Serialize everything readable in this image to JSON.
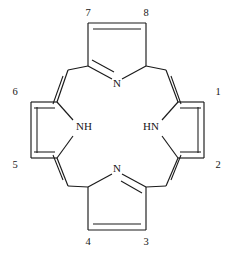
{
  "figure": {
    "kind": "chemical-structure-diagram",
    "name": "porphine",
    "background_color": "#ffffff",
    "line_color": "#1a1a1a",
    "width": 235,
    "height": 256
  },
  "atom_labels": [
    {
      "id": "nitrogen-top",
      "text": "N",
      "x": 117,
      "y": 84
    },
    {
      "id": "nitrogen-bottom",
      "text": "N",
      "x": 117,
      "y": 169
    },
    {
      "id": "nitrogen-left-nh",
      "text": "NH",
      "x": 84,
      "y": 127
    },
    {
      "id": "nitrogen-right-hn",
      "text": "HN",
      "x": 151,
      "y": 127
    }
  ],
  "locant_labels": [
    {
      "id": "locant-1",
      "text": "1",
      "x": 218,
      "y": 93
    },
    {
      "id": "locant-2",
      "text": "2",
      "x": 218,
      "y": 166
    },
    {
      "id": "locant-3",
      "text": "3",
      "x": 146,
      "y": 243
    },
    {
      "id": "locant-4",
      "text": "4",
      "x": 88,
      "y": 243
    },
    {
      "id": "locant-5",
      "text": "5",
      "x": 15,
      "y": 166
    },
    {
      "id": "locant-6",
      "text": "6",
      "x": 15,
      "y": 93
    },
    {
      "id": "locant-7",
      "text": "7",
      "x": 88,
      "y": 14
    },
    {
      "id": "locant-8",
      "text": "8",
      "x": 146,
      "y": 14
    }
  ],
  "bonds": [
    {
      "id": "top-ring-beta-beta",
      "x1": 88,
      "y1": 23,
      "x2": 146,
      "y2": 23
    },
    {
      "id": "top-ring-beta7-alpha",
      "x1": 88,
      "y1": 23,
      "x2": 88,
      "y2": 66
    },
    {
      "id": "top-ring-beta8-alpha",
      "x1": 146,
      "y1": 23,
      "x2": 146,
      "y2": 66
    },
    {
      "id": "top-ring-alpha-n-left",
      "x1": 88,
      "y1": 66,
      "x2": 112,
      "y2": 79
    },
    {
      "id": "top-ring-alpha-n-right",
      "x1": 146,
      "y1": 66,
      "x2": 122,
      "y2": 79
    },
    {
      "id": "bottom-ring-beta-beta",
      "x1": 88,
      "y1": 230,
      "x2": 146,
      "y2": 230
    },
    {
      "id": "bottom-ring-beta4-alpha",
      "x1": 88,
      "y1": 230,
      "x2": 88,
      "y2": 187
    },
    {
      "id": "bottom-ring-beta3-alpha",
      "x1": 146,
      "y1": 230,
      "x2": 146,
      "y2": 187
    },
    {
      "id": "bottom-ring-alpha-n-left",
      "x1": 88,
      "y1": 187,
      "x2": 112,
      "y2": 174
    },
    {
      "id": "bottom-ring-alpha-n-right",
      "x1": 146,
      "y1": 187,
      "x2": 122,
      "y2": 174
    },
    {
      "id": "left-ring-beta-beta",
      "x1": 31,
      "y1": 102,
      "x2": 31,
      "y2": 158
    },
    {
      "id": "left-ring-beta6-alpha",
      "x1": 31,
      "y1": 102,
      "x2": 57,
      "y2": 102
    },
    {
      "id": "left-ring-beta5-alpha",
      "x1": 31,
      "y1": 158,
      "x2": 57,
      "y2": 158
    },
    {
      "id": "left-ring-alpha-nh-top",
      "x1": 57,
      "y1": 102,
      "x2": 73,
      "y2": 120
    },
    {
      "id": "left-ring-alpha-nh-bottom",
      "x1": 57,
      "y1": 158,
      "x2": 73,
      "y2": 136
    },
    {
      "id": "right-ring-beta-beta",
      "x1": 204,
      "y1": 102,
      "x2": 204,
      "y2": 158
    },
    {
      "id": "right-ring-beta1-alpha",
      "x1": 204,
      "y1": 102,
      "x2": 178,
      "y2": 102
    },
    {
      "id": "right-ring-beta2-alpha",
      "x1": 204,
      "y1": 158,
      "x2": 178,
      "y2": 158
    },
    {
      "id": "right-ring-alpha-hn-top",
      "x1": 178,
      "y1": 102,
      "x2": 162,
      "y2": 120
    },
    {
      "id": "right-ring-alpha-hn-bottom",
      "x1": 178,
      "y1": 158,
      "x2": 162,
      "y2": 136
    },
    {
      "id": "meso-upper-left-to-top",
      "x1": 68,
      "y1": 70,
      "x2": 88,
      "y2": 66
    },
    {
      "id": "meso-upper-left-to-left",
      "x1": 68,
      "y1": 70,
      "x2": 57,
      "y2": 102
    },
    {
      "id": "meso-upper-right-to-top",
      "x1": 166,
      "y1": 70,
      "x2": 146,
      "y2": 66
    },
    {
      "id": "meso-upper-right-to-right",
      "x1": 166,
      "y1": 70,
      "x2": 178,
      "y2": 102
    },
    {
      "id": "meso-lower-left-to-bottom",
      "x1": 68,
      "y1": 186,
      "x2": 88,
      "y2": 187
    },
    {
      "id": "meso-lower-left-to-left",
      "x1": 68,
      "y1": 186,
      "x2": 57,
      "y2": 158
    },
    {
      "id": "meso-lower-right-to-bottom",
      "x1": 166,
      "y1": 186,
      "x2": 146,
      "y2": 187
    },
    {
      "id": "meso-lower-right-to-right",
      "x1": 166,
      "y1": 186,
      "x2": 178,
      "y2": 158
    }
  ],
  "double_bond_inner_lines": [
    {
      "id": "top-ring-beta-beta-inner",
      "x1": 93,
      "y1": 29,
      "x2": 141,
      "y2": 29
    },
    {
      "id": "top-ring-alpha-n-inner",
      "x1": 92,
      "y1": 60,
      "x2": 114,
      "y2": 72
    },
    {
      "id": "bottom-ring-beta-beta-inner",
      "x1": 93,
      "y1": 224,
      "x2": 141,
      "y2": 224
    },
    {
      "id": "bottom-ring-alpha-n-inner",
      "x1": 142,
      "y1": 193,
      "x2": 121,
      "y2": 181
    },
    {
      "id": "left-ring-beta-beta-inner",
      "x1": 37,
      "y1": 107,
      "x2": 37,
      "y2": 153
    },
    {
      "id": "right-ring-beta-beta-inner",
      "x1": 198,
      "y1": 107,
      "x2": 198,
      "y2": 153
    },
    {
      "id": "meso-upper-left-inner",
      "x1": 63,
      "y1": 76,
      "x2": 53,
      "y2": 104
    },
    {
      "id": "meso-upper-right-inner",
      "x1": 171,
      "y1": 76,
      "x2": 181,
      "y2": 104
    },
    {
      "id": "meso-lower-left-inner",
      "x1": 63,
      "y1": 180,
      "x2": 53,
      "y2": 155
    },
    {
      "id": "meso-lower-right-inner",
      "x1": 171,
      "y1": 180,
      "x2": 181,
      "y2": 155
    },
    {
      "id": "right-ring-beta1-alpha-inner",
      "x1": 180,
      "y1": 108,
      "x2": 201,
      "y2": 108
    },
    {
      "id": "right-ring-beta2-alpha-inner",
      "x1": 180,
      "y1": 152,
      "x2": 201,
      "y2": 152
    },
    {
      "id": "left-ring-beta6-alpha-inner",
      "x1": 34,
      "y1": 108,
      "x2": 55,
      "y2": 108
    },
    {
      "id": "left-ring-beta5-alpha-inner",
      "x1": 34,
      "y1": 152,
      "x2": 55,
      "y2": 152
    }
  ]
}
